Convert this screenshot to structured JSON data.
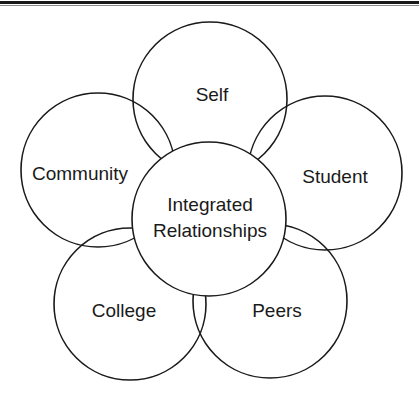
{
  "diagram": {
    "type": "relationship-venn",
    "center": {
      "lines": [
        "Integrated",
        "Relationships"
      ]
    },
    "nodes": [
      {
        "id": "self",
        "label": "Self"
      },
      {
        "id": "community",
        "label": "Community"
      },
      {
        "id": "student",
        "label": "Student"
      },
      {
        "id": "college",
        "label": "College"
      },
      {
        "id": "peers",
        "label": "Peers"
      }
    ]
  },
  "colors": {
    "stroke": "#1a1a1a",
    "background": "#ffffff",
    "rule_thin": "#8a8a8a"
  }
}
